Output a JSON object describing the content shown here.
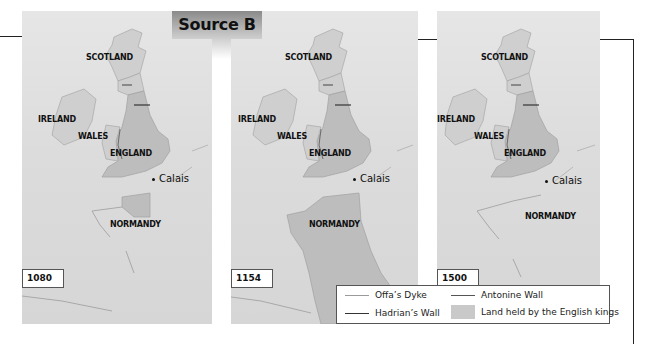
{
  "header": {
    "source_label": "Source B"
  },
  "maps": [
    {
      "year": "1080",
      "labels": {
        "scotland": "SCOTLAND",
        "ireland": "IRELAND",
        "wales": "WALES",
        "england": "ENGLAND",
        "calais": "Calais",
        "normandy": "NORMANDY"
      },
      "english_held": [
        "England",
        "Normandy"
      ]
    },
    {
      "year": "1154",
      "labels": {
        "scotland": "SCOTLAND",
        "ireland": "IRELAND",
        "wales": "WALES",
        "england": "ENGLAND",
        "calais": "Calais",
        "normandy": "NORMANDY"
      },
      "english_held": [
        "England",
        "Normandy",
        "Western France"
      ]
    },
    {
      "year": "1500",
      "labels": {
        "scotland": "SCOTLAND",
        "ireland": "IRELAND",
        "wales": "WALES",
        "england": "ENGLAND",
        "calais": "Calais",
        "normandy": "NORMANDY"
      },
      "english_held": [
        "England",
        "Calais"
      ]
    }
  ],
  "legend": {
    "offas_dyke": "Offa’s Dyke",
    "hadrians_wall": "Hadrian’s Wall",
    "antonine_wall": "Antonine Wall",
    "land_held": "Land held by the English kings"
  },
  "colors": {
    "sea": "#dcdcdc",
    "land": "#cfcfcf",
    "held": "#bdbdbd",
    "border": "#9a9a9a",
    "wall": "#444444"
  }
}
